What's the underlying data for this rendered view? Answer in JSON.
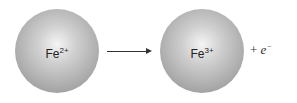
{
  "reactant": {
    "symbol": "Fe",
    "charge": "2+"
  },
  "product": {
    "symbol": "Fe",
    "charge": "3+"
  },
  "plus": "+",
  "electron": {
    "symbol": "e",
    "charge": "−"
  }
}
